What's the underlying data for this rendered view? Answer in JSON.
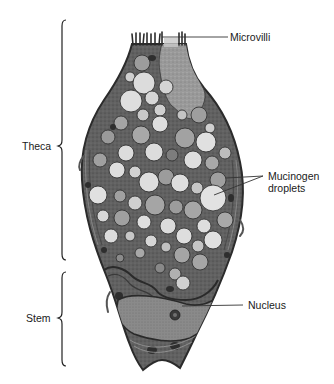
{
  "diagram": {
    "colors": {
      "background": "#ffffff",
      "cytoplasm": "#5e5e5e",
      "cell_border": "#2b2b2b",
      "droplet_light": "#d9d9d9",
      "droplet_mid": "#a8a8a8",
      "droplet_dark": "#7a7a7a",
      "nucleus": "#8c8c8c",
      "apical_region": "#9a9a9a",
      "line": "#333333",
      "text": "#1a1a1a"
    },
    "labels": {
      "microvilli": "Microvilli",
      "theca": "Theca",
      "mucinogen_droplets": "Mucinogen droplets",
      "stem": "Stem",
      "nucleus": "Nucleus"
    },
    "regions": [
      {
        "name": "Theca",
        "bracket_top_y": 20,
        "bracket_bottom_y": 260,
        "bracket_x": 62
      },
      {
        "name": "Stem",
        "bracket_top_y": 272,
        "bracket_bottom_y": 366,
        "bracket_x": 62
      }
    ]
  }
}
